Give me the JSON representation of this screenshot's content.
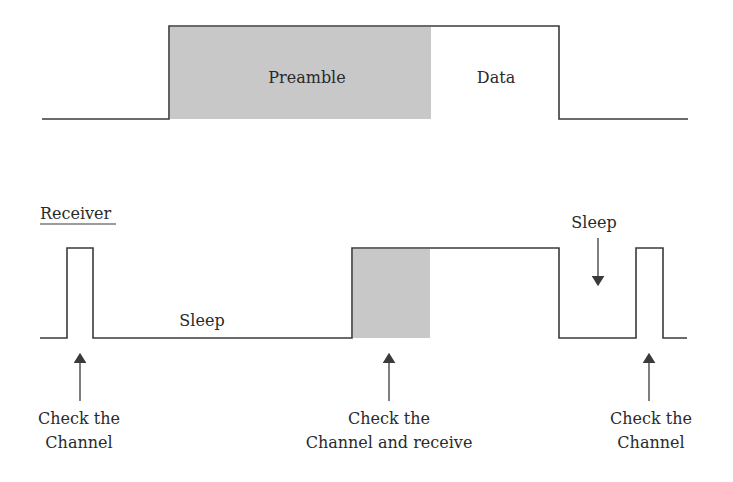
{
  "sender": {
    "preamble_label": "Preamble",
    "data_label": "Data",
    "waveform": {
      "start_x": 42,
      "rise_x": 169,
      "preamble_end_x": 431,
      "fall_x": 559,
      "end_x": 688,
      "low_y": 119,
      "high_y": 26
    }
  },
  "receiver": {
    "title": "Receiver",
    "sleep_label_1": "Sleep",
    "sleep_label_2": "Sleep",
    "annotations": [
      {
        "line1": "Check the",
        "line2": "Channel",
        "arrow_x": 80
      },
      {
        "line1": "Check the",
        "line2": "Channel and receive",
        "arrow_x": 389
      },
      {
        "line1": "Check the",
        "line2": "Channel",
        "arrow_x": 649
      }
    ]
  },
  "colors": {
    "line": "#3a3a3a",
    "shade": "#c8c8c8",
    "text": "#2a2a2a"
  }
}
